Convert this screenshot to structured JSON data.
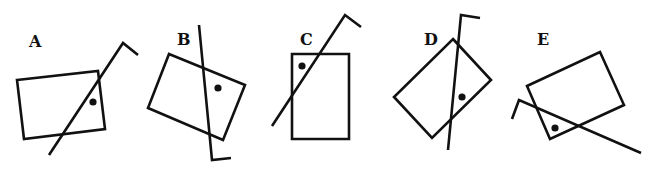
{
  "figures": [
    {
      "label": "A",
      "label_pos": [
        29,
        47
      ],
      "rect": "17,80 98,71 105,129 24,139",
      "line": "49,155 123,43 138,55",
      "dot": [
        93,
        102
      ]
    },
    {
      "label": "B",
      "label_pos": [
        177,
        45
      ],
      "rect": "169,54 245,85 223,140 148,108",
      "line": "199,25 212,160 231,158",
      "dot": [
        218,
        88
      ]
    },
    {
      "label": "C",
      "label_pos": [
        307,
        45
      ],
      "rect": "292,54 349,54 349,139 292,139",
      "line": "272,126 345,15 361,27",
      "dot": [
        302,
        66
      ]
    },
    {
      "label": "D",
      "label_pos": [
        430,
        45
      ],
      "rect": "453,39 491,80 432,138 394,97",
      "line": "448,150 461,15 480,18",
      "dot": [
        462,
        97
      ]
    },
    {
      "label": "E",
      "label_pos": [
        542,
        45
      ],
      "rect": "527,86 600,52 624,105 550,139",
      "line": "641,153 519,100 512,119",
      "dot": [
        555,
        128
      ]
    }
  ],
  "colors": {
    "stroke": "#111111",
    "background": "#ffffff"
  }
}
